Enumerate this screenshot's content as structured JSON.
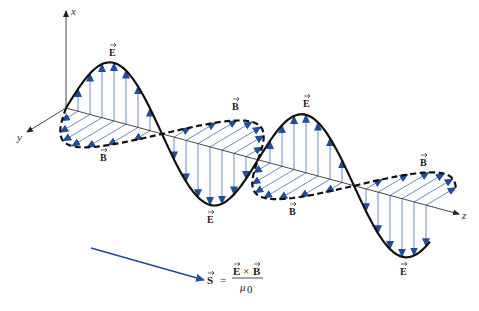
{
  "figure": {
    "type": "electromagnetic plane wave",
    "axes": {
      "x_label": "x",
      "y_label": "y",
      "z_label": "z"
    },
    "fields": {
      "electric": {
        "symbol": "E",
        "direction_axis": "x",
        "line_style": "solid"
      },
      "magnetic": {
        "symbol": "B",
        "direction_axis": "y",
        "line_style": "dashed"
      }
    },
    "wave": {
      "cycles_shown": 1.9,
      "phase_relation": "E and B in phase, perpendicular"
    },
    "labels": {
      "E": "E",
      "B": "B"
    },
    "formula": {
      "lhs": "S",
      "equals": "=",
      "numerator_left": "E",
      "cross": "×",
      "numerator_right": "B",
      "denominator": "μ",
      "denominator_subscript": "0"
    },
    "colors": {
      "field_vectors": "#5a7fb5",
      "arrowheads": "#1f4e9a",
      "poynting_arrow": "#1f4e9a",
      "wave_curves": "#111111"
    }
  }
}
